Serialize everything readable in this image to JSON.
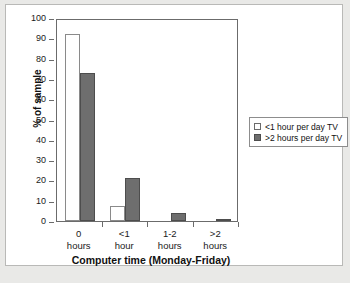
{
  "chart_data": {
    "type": "bar",
    "title": "",
    "xlabel": "Computer time (Monday-Friday)",
    "ylabel": "% of sample",
    "categories": [
      "0 hours",
      "<1 hour",
      "1-2 hours",
      ">2 hours"
    ],
    "category_lines": [
      [
        "0",
        "hours"
      ],
      [
        "<1",
        "hour"
      ],
      [
        "1-2",
        "hours"
      ],
      [
        ">2",
        "hours"
      ]
    ],
    "series": [
      {
        "name": "<1 hour per day TV",
        "color": "#ffffff",
        "values": [
          92,
          7.5,
          0,
          0
        ]
      },
      {
        "name": ">2 hours per day TV",
        "color": "#6e6e6e",
        "values": [
          73,
          21,
          4,
          1
        ]
      }
    ],
    "ylim": [
      0,
      100
    ],
    "yticks": [
      0,
      10,
      20,
      30,
      40,
      50,
      60,
      70,
      80,
      90,
      100
    ],
    "ytick_labels": [
      "0",
      "10",
      "20",
      "30",
      "40",
      "50",
      "60",
      "70",
      "80",
      "90",
      "100"
    ],
    "grid": false,
    "legend_position": "right"
  },
  "legend": {
    "entries": [
      {
        "label": "<1 hour per day TV",
        "swatch": "light"
      },
      {
        "label": ">2 hours per day TV",
        "swatch": "dark"
      }
    ]
  },
  "caption": {
    "text": ""
  }
}
